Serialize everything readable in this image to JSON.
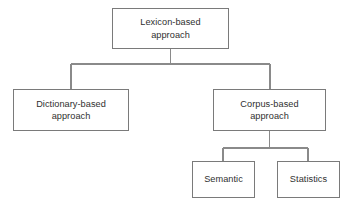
{
  "diagram": {
    "type": "tree",
    "background_color": "#ffffff",
    "border_color": "#7a7a7a",
    "text_color": "#2f2f2f",
    "connector_color": "#8a8a8a",
    "nodes": {
      "root": {
        "line_a": "Lexicon-based",
        "line_b": "approach"
      },
      "dictionary": {
        "line_a": "Dictionary-based",
        "line_b": "approach"
      },
      "corpus": {
        "line_a": "Corpus-based",
        "line_b": "approach"
      },
      "semantic": {
        "line_a": "Semantic",
        "line_b": ""
      },
      "statistics": {
        "line_a": "Statistics",
        "line_b": ""
      }
    }
  }
}
